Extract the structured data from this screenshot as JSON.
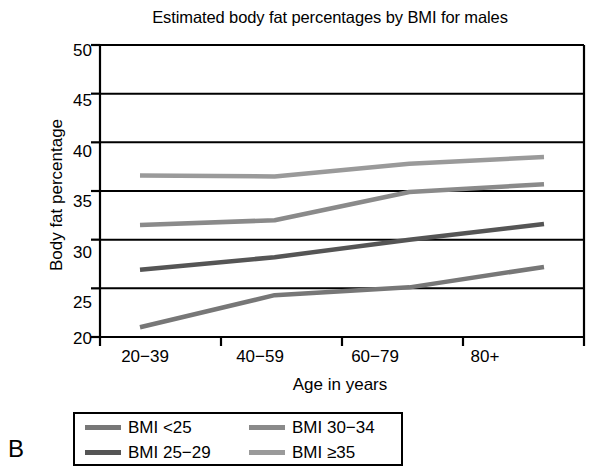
{
  "panel": {
    "label": "B"
  },
  "chart_data": {
    "type": "line",
    "title": "Estimated body fat percentages by BMI for males",
    "xlabel": "Age in years",
    "ylabel": "Body fat percentage",
    "categories": [
      "20−39",
      "40−59",
      "60−79",
      "80+"
    ],
    "ylim": [
      20,
      50
    ],
    "yticks": [
      20,
      25,
      30,
      35,
      40,
      45,
      50
    ],
    "ytick_labels": [
      "20",
      "25",
      "30",
      "35",
      "40",
      "45",
      "50"
    ],
    "grid": "horizontal",
    "legend_position": "below-plot",
    "series": [
      {
        "name": "BMI <25",
        "color": "#777777",
        "values": [
          21.0,
          24.3,
          25.1,
          27.2
        ]
      },
      {
        "name": "BMI 25−29",
        "color": "#555555",
        "values": [
          26.9,
          28.2,
          30.0,
          31.6
        ]
      },
      {
        "name": "BMI 30−34",
        "color": "#8a8a8a",
        "values": [
          31.5,
          32.0,
          34.9,
          35.7
        ]
      },
      {
        "name": "BMI ≥35",
        "color": "#9a9a9a",
        "values": [
          36.6,
          36.5,
          37.8,
          38.5
        ]
      }
    ]
  },
  "legend": {
    "entries": [
      {
        "label": "BMI <25",
        "color": "#777777"
      },
      {
        "label": "BMI 30−34",
        "color": "#8a8a8a"
      },
      {
        "label": "BMI 25−29",
        "color": "#555555"
      },
      {
        "label": "BMI ≥35",
        "color": "#9a9a9a"
      }
    ]
  },
  "axis": {
    "y_ticks": [
      "50",
      "45",
      "40",
      "35",
      "30",
      "25",
      "20"
    ],
    "x_ticks": [
      "20−39",
      "40−59",
      "60−79",
      "80+"
    ]
  }
}
